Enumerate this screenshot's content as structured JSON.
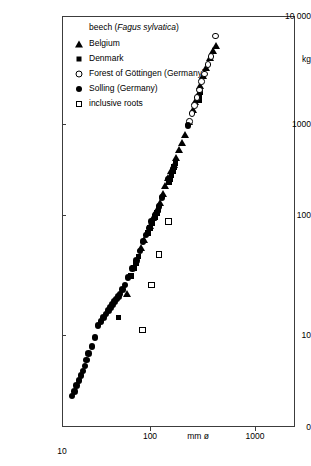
{
  "chart_data": {
    "type": "scatter",
    "title": "beech (Fagus sylvatica)",
    "title_plain": "beech (",
    "title_italic": "Fagus sylvatica",
    "title_close": ")",
    "xlabel": "mm ø",
    "ylabel": "kg",
    "xscale": "log",
    "yscale": "log",
    "xlim": [
      10,
      2000
    ],
    "ylim": [
      1,
      10000
    ],
    "grid": false,
    "legend_position": "top-left inside",
    "x_ticks": [
      {
        "value": 10,
        "label": "10"
      },
      {
        "value": 100,
        "label": "100"
      },
      {
        "value": 1000,
        "label": "1000"
      }
    ],
    "y_ticks": [
      {
        "value": 10000,
        "label": "10 000"
      },
      {
        "value": 1000,
        "label": "1000"
      },
      {
        "value": 100,
        "label": "100"
      },
      {
        "value": 10,
        "label": "10"
      },
      {
        "value": 0,
        "label": "0"
      }
    ],
    "axis_unit_labels": {
      "y_unit": "kg",
      "x_unit": "mm ø"
    },
    "series": [
      {
        "name": "Belgium",
        "marker": "filled-triangle",
        "color": "#000000",
        "points": [
          [
            520,
            5400
          ],
          [
            560,
            5500
          ],
          [
            600,
            5300
          ],
          [
            430,
            2600
          ],
          [
            400,
            2350
          ],
          [
            370,
            2050
          ],
          [
            345,
            1700
          ],
          [
            320,
            1450
          ],
          [
            300,
            1200
          ],
          [
            285,
            1000
          ],
          [
            270,
            880
          ],
          [
            255,
            760
          ],
          [
            235,
            600
          ],
          [
            215,
            470
          ],
          [
            200,
            400
          ],
          [
            190,
            350
          ],
          [
            178,
            300
          ],
          [
            170,
            265
          ],
          [
            160,
            235
          ],
          [
            150,
            205
          ],
          [
            140,
            175
          ],
          [
            132,
            150
          ],
          [
            124,
            128
          ],
          [
            116,
            110
          ],
          [
            108,
            95
          ],
          [
            100,
            82
          ],
          [
            94,
            72
          ],
          [
            88,
            62
          ],
          [
            82,
            53
          ],
          [
            60,
            22
          ]
        ]
      },
      {
        "name": "Denmark",
        "marker": "filled-square",
        "color": "#000000",
        "points": [
          [
            300,
            1050
          ],
          [
            295,
            980
          ],
          [
            292,
            900
          ],
          [
            175,
            270
          ],
          [
            170,
            250
          ],
          [
            165,
            232
          ],
          [
            160,
            215
          ],
          [
            156,
            200
          ],
          [
            152,
            188
          ],
          [
            120,
            112
          ],
          [
            116,
            104
          ],
          [
            112,
            96
          ],
          [
            105,
            86
          ],
          [
            100,
            78
          ],
          [
            96,
            71
          ],
          [
            78,
            45
          ],
          [
            74,
            40
          ],
          [
            70,
            36
          ],
          [
            66,
            31
          ],
          [
            50,
            14
          ]
        ]
      },
      {
        "name": "Forest of Göttingen (Germany)",
        "marker": "open-circle",
        "color": "#000000",
        "points": [
          [
            420,
            3100
          ],
          [
            380,
            2100
          ],
          [
            355,
            1800
          ],
          [
            330,
            1500
          ],
          [
            310,
            1300
          ],
          [
            295,
            1100
          ],
          [
            280,
            950
          ],
          [
            265,
            820
          ],
          [
            250,
            700
          ],
          [
            238,
            600
          ]
        ]
      },
      {
        "name": "Solling (Germany)",
        "marker": "filled-circle",
        "color": "#000000",
        "points": [
          [
            230,
            560
          ],
          [
            150,
            200
          ],
          [
            130,
            140
          ],
          [
            122,
            118
          ],
          [
            112,
            100
          ],
          [
            104,
            88
          ],
          [
            98,
            78
          ],
          [
            92,
            68
          ],
          [
            86,
            60
          ],
          [
            80,
            50
          ],
          [
            74,
            42
          ],
          [
            68,
            36
          ],
          [
            62,
            30
          ],
          [
            58,
            26
          ],
          [
            55,
            24
          ],
          [
            52,
            22
          ],
          [
            50,
            21
          ],
          [
            48,
            20
          ],
          [
            46,
            19
          ],
          [
            44,
            18
          ],
          [
            42,
            17
          ],
          [
            40,
            16
          ],
          [
            38,
            15
          ],
          [
            36,
            14
          ],
          [
            34,
            13
          ],
          [
            32,
            12
          ],
          [
            30,
            9.5
          ],
          [
            28,
            8.0
          ],
          [
            26,
            7.0
          ],
          [
            25,
            6.2
          ],
          [
            24,
            5.5
          ],
          [
            23,
            5.0
          ],
          [
            22,
            4.6
          ],
          [
            21,
            4.2
          ],
          [
            20,
            3.8
          ],
          [
            19,
            3.4
          ],
          [
            18,
            3.1
          ]
        ]
      },
      {
        "name": "inclusive roots",
        "marker": "open-square",
        "color": "#000000",
        "points": [
          [
            150,
            88
          ],
          [
            122,
            47
          ],
          [
            103,
            26
          ],
          [
            85,
            11
          ]
        ]
      }
    ]
  },
  "legend": {
    "title": "beech (Fagus sylvatica)",
    "title_prefix": "beech (",
    "title_species": "Fagus sylvatica",
    "title_suffix": ")",
    "items": [
      {
        "label": "Belgium",
        "marker": "filled-triangle"
      },
      {
        "label": "Denmark",
        "marker": "filled-square"
      },
      {
        "label": "Forest of Göttingen (Germany)",
        "marker": "open-circle"
      },
      {
        "label": "Solling (Germany)",
        "marker": "filled-circle"
      },
      {
        "label": "inclusive roots",
        "marker": "open-square"
      }
    ]
  },
  "axes": {
    "y_top_label": "10 000",
    "y_unit_label": "kg",
    "y_1000": "1000",
    "y_100": "100",
    "y_10": "10",
    "y_0": "0",
    "x_10": "10",
    "x_100": "100",
    "x_unit_label": "mm ø",
    "x_1000": "1000"
  }
}
